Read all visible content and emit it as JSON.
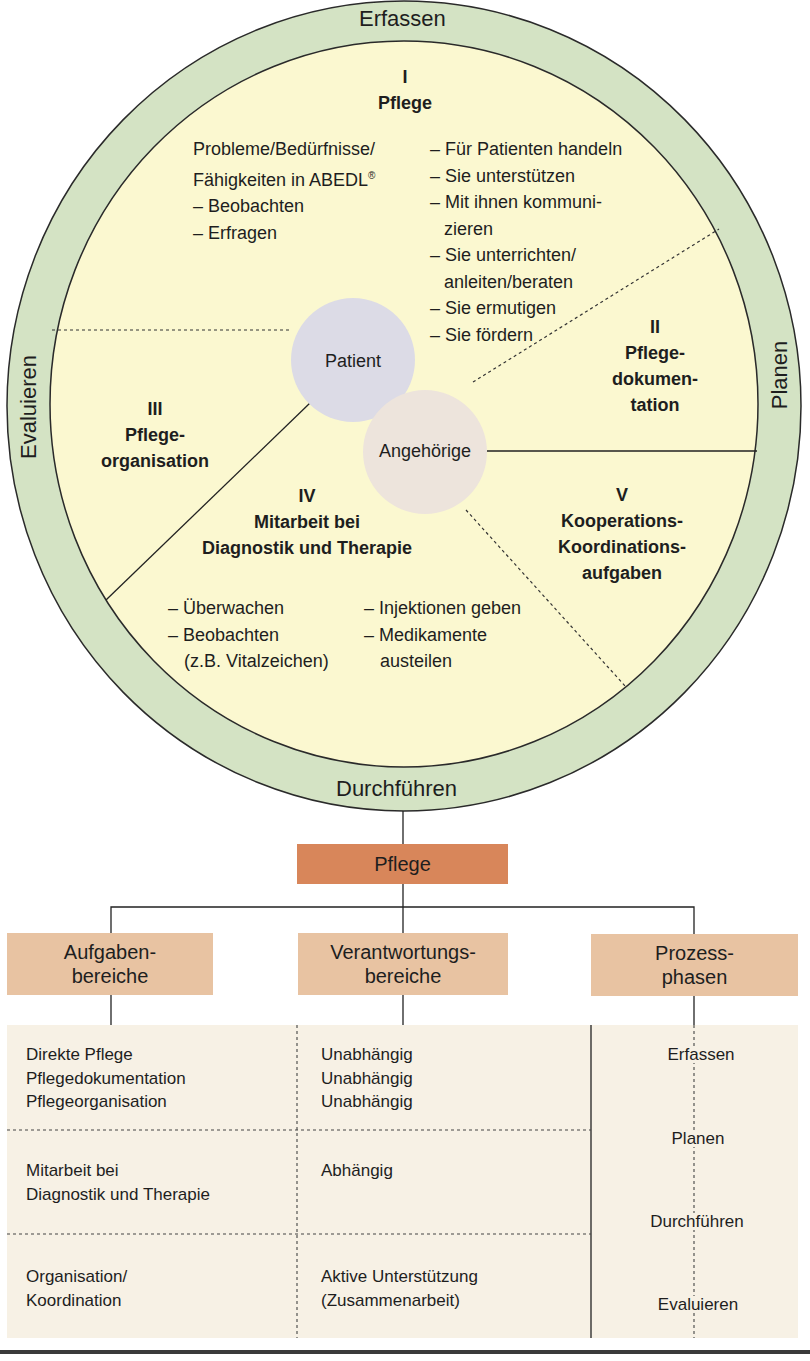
{
  "colors": {
    "ring": "#d4e3c4",
    "inner": "#fbf8d0",
    "patient": "#dcdbe6",
    "angehoerige": "#ede4dc",
    "pflege_box": "#d8865a",
    "category_box": "#e8c3a2",
    "table_bg": "#f7f1e5",
    "line": "#222222"
  },
  "ring": {
    "top": "Erfassen",
    "right": "Planen",
    "bottom": "Durchführen",
    "left": "Evaluieren"
  },
  "center": {
    "patient": "Patient",
    "angehoerige": "Angehörige"
  },
  "sections": {
    "s1": {
      "numeral": "I",
      "title": "Pflege",
      "left_lines": [
        "Probleme/Bedürfnisse/",
        "Fähigkeiten in ABEDL",
        "– Beobachten",
        "– Erfragen"
      ],
      "left_sup": "®",
      "right_lines": [
        "– Für Patienten handeln",
        "– Sie unterstützen",
        "– Mit ihnen kommuni-",
        "zieren",
        "– Sie unterrichten/",
        "anleiten/beraten",
        "– Sie ermutigen",
        "– Sie fördern"
      ]
    },
    "s2": {
      "numeral": "II",
      "title_lines": [
        "Pflege-",
        "dokumen-",
        "tation"
      ]
    },
    "s3": {
      "numeral": "III",
      "title_lines": [
        "Pflege-",
        "organisation"
      ]
    },
    "s4": {
      "numeral": "IV",
      "title_lines": [
        "Mitarbeit bei",
        "Diagnostik und Therapie"
      ],
      "left_lines": [
        "– Überwachen",
        "– Beobachten",
        "(z.B. Vitalzeichen)"
      ],
      "right_lines": [
        "– Injektionen geben",
        "– Medikamente",
        "austeilen"
      ]
    },
    "s5": {
      "numeral": "V",
      "title_lines": [
        "Kooperations-",
        "Koordinations-",
        "aufgaben"
      ]
    }
  },
  "tree": {
    "root": "Pflege",
    "categories": [
      {
        "lines": [
          "Aufgaben-",
          "bereiche"
        ]
      },
      {
        "lines": [
          "Verantwortungs-",
          "bereiche"
        ]
      },
      {
        "lines": [
          "Prozess-",
          "phasen"
        ]
      }
    ]
  },
  "table": {
    "rows": [
      {
        "aufgaben": [
          "Direkte Pflege",
          "Pflegedokumentation",
          "Pflegeorganisation"
        ],
        "verantwortung": [
          "Unabhängig",
          "Unabhängig",
          "Unabhängig"
        ]
      },
      {
        "aufgaben": [
          "Mitarbeit bei",
          "Diagnostik und Therapie"
        ],
        "verantwortung": [
          "Abhängig"
        ]
      },
      {
        "aufgaben": [
          "Organisation/",
          "Koordination"
        ],
        "verantwortung": [
          "Aktive Unterstützung",
          "(Zusammenarbeit)"
        ]
      }
    ],
    "phases": [
      "Erfassen",
      "Planen",
      "Durchführen",
      "Evaluieren"
    ]
  }
}
